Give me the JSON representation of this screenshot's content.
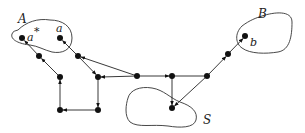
{
  "diagram": {
    "type": "directed-graph",
    "regions": [
      {
        "id": "A",
        "label": "A"
      },
      {
        "id": "B",
        "label": "B"
      },
      {
        "id": "S",
        "label": "S"
      }
    ],
    "node_labels": {
      "a_star": "a",
      "a_star_sup": "*",
      "a": "a",
      "b": "b"
    },
    "nodes": [
      {
        "id": "a_star",
        "x": 22,
        "y": 38
      },
      {
        "id": "a",
        "x": 60,
        "y": 38
      },
      {
        "id": "n1",
        "x": 39,
        "y": 56
      },
      {
        "id": "n2",
        "x": 78,
        "y": 56
      },
      {
        "id": "n3",
        "x": 60,
        "y": 77
      },
      {
        "id": "n4",
        "x": 98,
        "y": 77
      },
      {
        "id": "n5",
        "x": 60,
        "y": 110
      },
      {
        "id": "n6",
        "x": 98,
        "y": 110
      },
      {
        "id": "n7",
        "x": 137,
        "y": 76
      },
      {
        "id": "n8",
        "x": 172,
        "y": 76
      },
      {
        "id": "n9",
        "x": 207,
        "y": 76
      },
      {
        "id": "n10",
        "x": 228,
        "y": 54
      },
      {
        "id": "b",
        "x": 245,
        "y": 36
      },
      {
        "id": "s",
        "x": 172,
        "y": 108
      }
    ],
    "edges": [
      {
        "from": "n1",
        "to": "a_star"
      },
      {
        "from": "n3",
        "to": "n1"
      },
      {
        "from": "n5",
        "to": "n3"
      },
      {
        "from": "n6",
        "to": "n5"
      },
      {
        "from": "n4",
        "to": "n6"
      },
      {
        "from": "n7",
        "to": "n4"
      },
      {
        "from": "n2",
        "to": "n4"
      },
      {
        "from": "n2",
        "to": "a"
      },
      {
        "from": "n7",
        "to": "n2"
      },
      {
        "from": "n7",
        "to": "n8"
      },
      {
        "from": "n8",
        "to": "s"
      },
      {
        "from": "n8",
        "to": "n9"
      },
      {
        "from": "n9",
        "to": "s"
      },
      {
        "from": "n9",
        "to": "n10"
      },
      {
        "from": "n10",
        "to": "b"
      }
    ]
  }
}
